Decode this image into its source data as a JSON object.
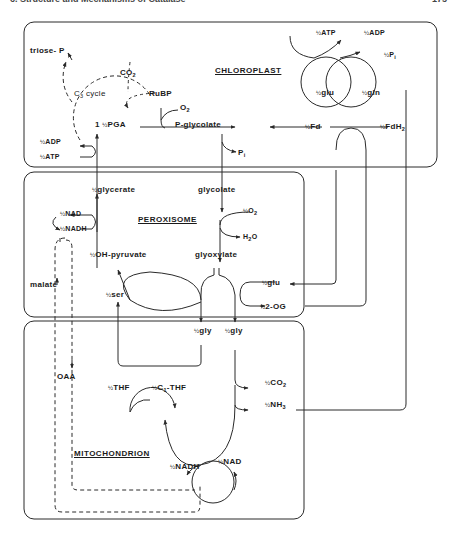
{
  "page": {
    "header": "6. Structure and Mechanisms of Catalase",
    "page_number": "175"
  },
  "compartments": {
    "chloroplast": "CHLOROPLAST",
    "peroxisome": "PEROXISOME",
    "mitochondrion": "MITOCHONDRION"
  },
  "chloroplast": {
    "triose_p": "triose- P",
    "co2": "CO",
    "co2_sub": "2",
    "c3_cycle": "C",
    "c3_sub": "3",
    "c3_rest": " cycle",
    "rubp": "RuBP",
    "o2": "O",
    "o2_sub": "2",
    "pga_prefix": "1 ",
    "pga": "PGA",
    "p_glycolate": "P-glycolate",
    "pi": "P",
    "pi_sub": "i",
    "adp": "ADP",
    "atp": "ATP",
    "atp_top": "ATP",
    "adp_top": "ADP",
    "pi_top": "P",
    "pi_top_sub": "i",
    "glu": "glu",
    "gln": "gln",
    "fd": "Fd",
    "fdh2": "FdH",
    "fdh2_sub": "2"
  },
  "peroxisome": {
    "glycerate": "glycerate",
    "glycolate": "glycolate",
    "o2": "O",
    "o2_sub": "2",
    "h2o": "H",
    "h2o_sub": "2",
    "h2o_end": "O",
    "nad": "NAD",
    "nadh": "NADH",
    "oh_pyruvate": "OH-pyruvate",
    "glyoxylate": "glyoxylate",
    "malate": "malate",
    "ser": "ser",
    "glu": "glu",
    "og": "2-OG"
  },
  "mitochondrion": {
    "gly1": "gly",
    "gly2": "gly",
    "oaa": "OAA",
    "thf": "THF",
    "c1_thf": "C",
    "c1_sub": "1",
    "c1_rest": "-THF",
    "co2": "CO",
    "co2_sub": "2",
    "nh3": "NH",
    "nh3_sub": "3",
    "nadh": "NADH",
    "nad": "NAD"
  },
  "half": "½",
  "colors": {
    "line": "#2a2a2a",
    "background": "#ffffff"
  }
}
